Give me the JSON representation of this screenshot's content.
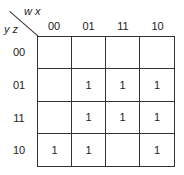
{
  "kmap": {
    "column_variables": "w x",
    "row_variables": "y z",
    "column_headers": [
      "00",
      "01",
      "11",
      "10"
    ],
    "row_headers": [
      "00",
      "01",
      "11",
      "10"
    ],
    "cells": [
      [
        "",
        "",
        "",
        ""
      ],
      [
        "",
        "1",
        "1",
        "1"
      ],
      [
        "",
        "1",
        "1",
        "1"
      ],
      [
        "1",
        "1",
        "",
        "1"
      ]
    ]
  }
}
